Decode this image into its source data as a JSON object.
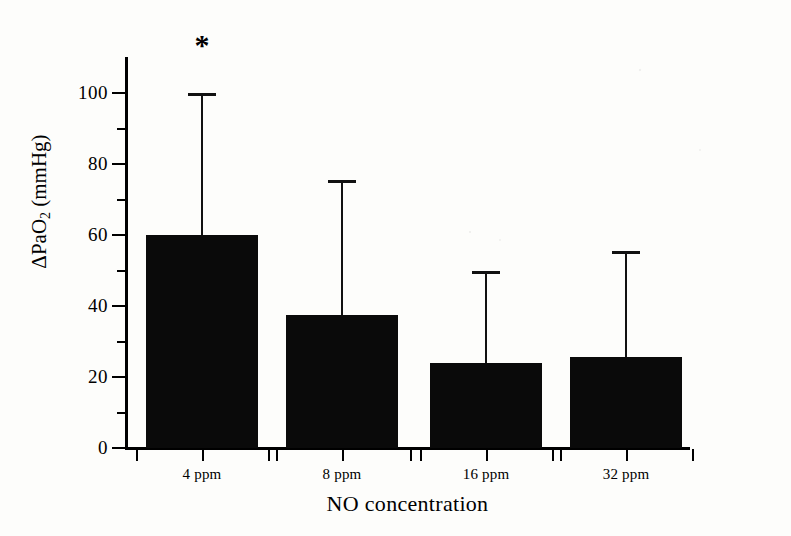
{
  "figure": {
    "sig_marker": "*",
    "sig_marker_category": "4 ppm"
  },
  "chart_data": {
    "type": "bar",
    "title": "",
    "xlabel": "NO concentration",
    "ylabel": "ΔPaO2 (mmHg)",
    "ylabel_parts": {
      "main": "ΔPaO",
      "sub": "2",
      "unit": " (mmHg)"
    },
    "categories": [
      "4 ppm",
      "8 ppm",
      "16 ppm",
      "32 ppm"
    ],
    "values": [
      60,
      37.5,
      24,
      25.5
    ],
    "error_upper": [
      40,
      38,
      26,
      30
    ],
    "error_bar_tops": [
      100,
      75.5,
      50,
      55.5
    ],
    "error_bar_type": "upper-only (SD)",
    "ylim": [
      0,
      110
    ],
    "ytick_values": [
      0,
      20,
      40,
      60,
      80,
      100
    ],
    "ytick_labels": [
      "0",
      "20",
      "40",
      "60",
      "80",
      "100"
    ],
    "yminor_tick_values": [
      10,
      30,
      50,
      70,
      90
    ],
    "grid": false,
    "legend": "none",
    "bar_color": "#0a0a0a",
    "annotations": [
      {
        "text": "*",
        "category": "4 ppm",
        "meaning": "significant"
      }
    ]
  }
}
